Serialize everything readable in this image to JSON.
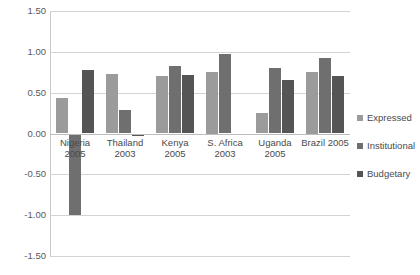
{
  "chart_data": {
    "type": "bar",
    "title": "",
    "xlabel": "",
    "ylabel": "",
    "ylim": [
      -1.5,
      1.5
    ],
    "ytick_step": 0.5,
    "grid": true,
    "legend_position": "right",
    "categories": [
      "Nigeria 2005",
      "Thailand\n2003",
      "Kenya 2005",
      "S. Africa\n2003",
      "Uganda 2005",
      "Brazil 2005"
    ],
    "ytick_labels": [
      "1.50",
      "1.00",
      "0.50",
      "0.00",
      "-0.50",
      "-1.00",
      "-1.50"
    ],
    "ytick_values": [
      1.5,
      1.0,
      0.5,
      0.0,
      -0.5,
      -1.0,
      -1.5
    ],
    "series": [
      {
        "name": "Expressed",
        "color": "#9b9b9b",
        "values": [
          0.43,
          0.73,
          0.7,
          0.75,
          0.25,
          0.75
        ]
      },
      {
        "name": "Institutional",
        "color": "#6f6f6f",
        "values": [
          -1.0,
          0.29,
          0.83,
          0.97,
          0.8,
          0.93
        ]
      },
      {
        "name": "Budgetary",
        "color": "#555555",
        "values": [
          0.78,
          -0.03,
          0.72,
          -0.02,
          0.66,
          0.71
        ]
      }
    ]
  }
}
